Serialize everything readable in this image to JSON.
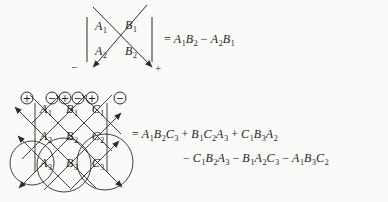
{
  "colors": {
    "ink": "#2b2b2b",
    "background": "#fafaf8"
  },
  "det2": {
    "entries": [
      "A_1",
      "B_1",
      "A_2",
      "B_2"
    ],
    "neg_label": "−",
    "pos_label": "+",
    "equation": [
      "=",
      "A_1",
      "B_2",
      "−",
      "A_2",
      "B_1"
    ]
  },
  "det3": {
    "signs": [
      "+",
      "−",
      "+",
      "−",
      "+",
      "−"
    ],
    "entries": [
      "A_1",
      "B_1",
      "C_1",
      "A_2",
      "B_2",
      "C_2",
      "A_3",
      "B_3",
      "C_3"
    ],
    "equation_line1": [
      "=",
      "A_1",
      "B_2",
      "C_3",
      "+",
      "B_1",
      "C_2",
      "A_3",
      "+",
      "C_1",
      "B_3",
      "A_2"
    ],
    "equation_line2": [
      "−",
      "C_1",
      "B_2",
      "A_3",
      "−",
      "B_1",
      "A_2",
      "C_3",
      "−",
      "A_1",
      "B_3",
      "C_2"
    ]
  }
}
